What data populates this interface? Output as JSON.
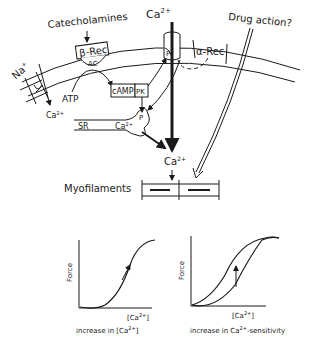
{
  "labels": {
    "catecholamines": "Catecholamines",
    "beta_rec": "β-Rec",
    "ac": "AC",
    "ca_top": "Ca",
    "ca_top_sup": "2+",
    "drug_action": "Drug action?",
    "alpha_rec": "α-Rec",
    "p_channel": "P",
    "na": "Na",
    "na_sup": "+",
    "ca_exchanger": "Ca",
    "ca_exchanger_sup": "2+",
    "atp": "ATP",
    "camp": "cAMP",
    "pk": "PK",
    "sr": "SR",
    "ca_sr": "Ca",
    "ca_sr_sup": "2+",
    "p_sr": "P",
    "ca_mid": "Ca",
    "ca_mid_sup": "2+",
    "myofilaments": "Myofilaments"
  },
  "graphs": [
    {
      "ylabel": "Force",
      "xlabel": "[Ca2+]",
      "xlabel_base": "[Ca",
      "xlabel_sup": "2+",
      "xlabel_end": "]",
      "caption_base": "increase in [Ca",
      "caption_sup": "2+",
      "caption_end": "]"
    },
    {
      "ylabel": "Force",
      "xlabel_base": "[Ca",
      "xlabel_sup": "2+",
      "xlabel_end": "]",
      "caption_base": "increase in Ca",
      "caption_sup": "2+",
      "caption_end": "-sensitivity"
    }
  ],
  "colors": {
    "ink": "#1a1a1a",
    "background": "#ffffff"
  }
}
